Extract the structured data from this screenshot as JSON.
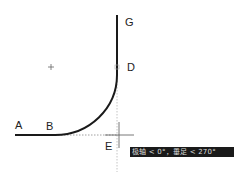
{
  "diagram": {
    "points": [
      {
        "label": "A",
        "x": 19,
        "y": 120
      },
      {
        "label": "B",
        "x": 48,
        "y": 120
      },
      {
        "label": "G",
        "x": 126,
        "y": 17
      },
      {
        "label": "D",
        "x": 127,
        "y": 62
      },
      {
        "label": "E",
        "x": 105,
        "y": 142
      }
    ],
    "center_marker": "+",
    "tooltip": "极轴 < 0°，垂足 < 270°",
    "colors": {
      "line": "#1a1a1a",
      "guide": "#aaaaaa",
      "tooltip_bg": "#1a1a1a",
      "tooltip_text": "#dddddd"
    }
  }
}
